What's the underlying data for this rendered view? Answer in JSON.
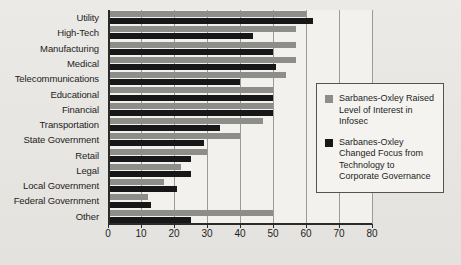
{
  "chart_data": {
    "type": "bar",
    "orientation": "horizontal",
    "title": "",
    "xlabel": "",
    "ylabel": "",
    "xlim": [
      0,
      80
    ],
    "xticks": [
      0,
      10,
      20,
      30,
      40,
      50,
      60,
      70,
      80
    ],
    "grid": true,
    "legend_position": "right",
    "categories": [
      "Utility",
      "High-Tech",
      "Manufacturing",
      "Medical",
      "Telecommunications",
      "Educational",
      "Financial",
      "Transportation",
      "State Government",
      "Retail",
      "Legal",
      "Local Government",
      "Federal Government",
      "Other"
    ],
    "series": [
      {
        "name": "Sarbanes-Oxley Raised Level of Interest in Infosec",
        "color": "#8d8d8a",
        "values": [
          60,
          57,
          57,
          57,
          54,
          50,
          50,
          47,
          40,
          30,
          22,
          17,
          12,
          50
        ]
      },
      {
        "name": "Sarbanes-Oxley Changed Focus from Technology to Corporate Governance",
        "color": "#171717",
        "values": [
          62,
          44,
          50,
          51,
          40,
          50,
          50,
          34,
          29,
          25,
          25,
          21,
          13,
          25
        ]
      }
    ]
  },
  "legend": {
    "items": [
      {
        "swatch": "gray",
        "label": "Sarbanes-Oxley Raised Level of Interest in Infosec"
      },
      {
        "swatch": "black",
        "label": "Sarbanes-Oxley Changed Focus from Technology to Corporate Governance"
      }
    ]
  },
  "axis": {
    "x_tick_labels": [
      "0",
      "10",
      "20",
      "30",
      "40",
      "50",
      "60",
      "70",
      "80"
    ]
  },
  "colors": {
    "series_gray": "#8d8d8a",
    "series_black": "#171717",
    "plot_background": "#f2f1ee",
    "page_background": "#e9e8e4",
    "axis": "#2a2a2a",
    "gridline": "#9a9a96"
  }
}
